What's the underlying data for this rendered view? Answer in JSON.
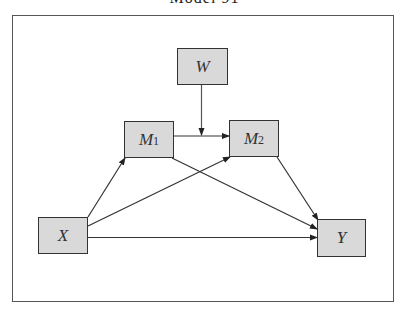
{
  "title": "Model 91",
  "nodes": {
    "W": {
      "label": "W",
      "sub": ""
    },
    "M1": {
      "label": "M",
      "sub": "1"
    },
    "M2": {
      "label": "M",
      "sub": "2"
    },
    "X": {
      "label": "X",
      "sub": ""
    },
    "Y": {
      "label": "Y",
      "sub": ""
    }
  },
  "edges": [
    {
      "from": "X",
      "to": "M1"
    },
    {
      "from": "X",
      "to": "M2"
    },
    {
      "from": "X",
      "to": "Y"
    },
    {
      "from": "M1",
      "to": "M2"
    },
    {
      "from": "M1",
      "to": "Y"
    },
    {
      "from": "M2",
      "to": "Y"
    },
    {
      "from": "W",
      "to": "M1->M2",
      "type": "moderation"
    }
  ],
  "colors": {
    "node_fill": "#d9d9d9",
    "node_border": "#333333",
    "edge": "#333333",
    "frame": "#555555"
  }
}
